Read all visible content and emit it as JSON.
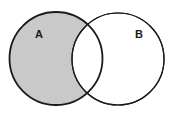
{
  "figure": {
    "kind": "venn-diagram",
    "background_color": "#ffffff",
    "width": 179,
    "height": 117
  },
  "chart_data": {
    "type": "diagram",
    "diagram_type": "venn",
    "title": "",
    "xlabel": "",
    "ylabel": "",
    "sets": [
      {
        "id": "A",
        "label": "A",
        "cx": 56,
        "cy": 58.5,
        "r": 46.5,
        "fill": "#c9c9c9",
        "stroke": "#1a1a1a",
        "stroke_width": 1.8,
        "label_x": 39,
        "label_y": 35
      },
      {
        "id": "B",
        "label": "B",
        "cx": 118,
        "cy": 59,
        "r": 46,
        "fill": "#ffffff",
        "stroke": "#1a1a1a",
        "stroke_width": 1.2,
        "label_x": 139,
        "label_y": 35
      }
    ],
    "regions": [
      {
        "id": "A-only",
        "expression": "A \\ B",
        "shaded": true,
        "fill": "#c9c9c9"
      },
      {
        "id": "intersection",
        "expression": "A ∩ B",
        "shaded": false,
        "fill": "#ffffff"
      },
      {
        "id": "B-only",
        "expression": "B \\ A",
        "shaded": false,
        "fill": "#ffffff"
      }
    ],
    "shaded_region": "A-only",
    "legend": [],
    "annotations": [
      "A",
      "B"
    ]
  },
  "labels": {
    "set_a": "A",
    "set_b": "B"
  },
  "colors": {
    "shade": "#c9c9c9",
    "outline": "#1a1a1a",
    "background": "#ffffff"
  }
}
